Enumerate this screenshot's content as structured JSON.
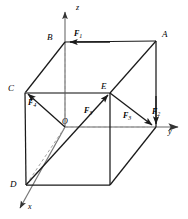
{
  "figure": {
    "type": "3d-cube-force-diagram",
    "background_color": "#ffffff",
    "line_color": "#1a1a1a",
    "axis_color": "#555555",
    "dashed_color": "#8a8a8a"
  },
  "axes": [
    {
      "name": "x",
      "label": "x",
      "label_x": 28,
      "label_y": 203,
      "direction": "down-left"
    },
    {
      "name": "y",
      "label": "y",
      "label_x": 168,
      "label_y": 128,
      "direction": "right"
    },
    {
      "name": "z",
      "label": "z",
      "label_x": 76,
      "label_y": 4,
      "direction": "up"
    }
  ],
  "vertices": [
    {
      "name": "A",
      "label": "A",
      "label_x": 162,
      "label_y": 30,
      "px": 156,
      "py": 41
    },
    {
      "name": "B",
      "label": "B",
      "label_x": 47,
      "label_y": 33,
      "px": 65,
      "py": 42
    },
    {
      "name": "C",
      "label": "C",
      "label_x": 8,
      "label_y": 84,
      "px": 25,
      "py": 93
    },
    {
      "name": "D",
      "label": "D",
      "label_x": 10,
      "label_y": 180,
      "px": 26,
      "py": 185
    },
    {
      "name": "E",
      "label": "E",
      "label_x": 101,
      "label_y": 82,
      "px": 110,
      "py": 93
    },
    {
      "name": "O",
      "label": "O",
      "label_x": 62,
      "label_y": 118,
      "px": 65,
      "py": 127
    }
  ],
  "forces": [
    {
      "name": "F1",
      "label": "F",
      "subscript": "1",
      "label_x": 74,
      "label_y": 30,
      "from": "A",
      "to": "B",
      "note": "along top edge A to B"
    },
    {
      "name": "F2",
      "label": "F",
      "subscript": "2",
      "label_x": 152,
      "label_y": 108,
      "from": "above",
      "to": "y-corner",
      "note": "vertical downward at right front corner"
    },
    {
      "name": "F3",
      "label": "F",
      "subscript": "3",
      "label_x": 84,
      "label_y": 107,
      "from": "D",
      "to": "E",
      "note": "space diagonal D to E"
    },
    {
      "name": "F3b",
      "label": "F",
      "subscript": "3",
      "label_x": 123,
      "label_y": 112,
      "from": "E",
      "to": "y-corner",
      "note": "from E down-right to front corner"
    },
    {
      "name": "F4",
      "label": "F",
      "subscript": "4",
      "label_x": 28,
      "label_y": 99,
      "from": "O",
      "to": "C",
      "note": "from origin O to vertex C"
    }
  ]
}
